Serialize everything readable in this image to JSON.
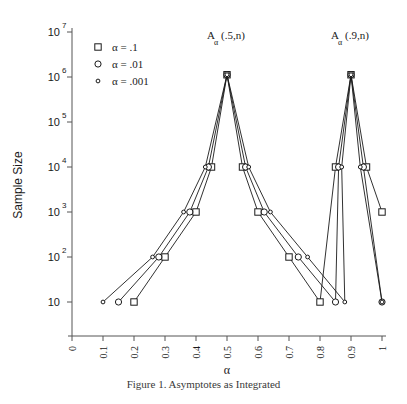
{
  "figure": {
    "caption": "Figure 1.  Asymptotes as Integrated"
  },
  "chart_data": {
    "type": "line",
    "title": "",
    "xlabel": "α",
    "ylabel": "Sample Size",
    "xlim": [
      0,
      1
    ],
    "ylim_log10": [
      1,
      7
    ],
    "yscale": "log",
    "xticks": [
      "0",
      "0.1",
      "0.2",
      "0.3",
      "0.4",
      "0.5",
      "0.6",
      "0.7",
      "0.8",
      "0.9",
      "1"
    ],
    "xtick_values": [
      0,
      0.1,
      0.2,
      0.3,
      0.4,
      0.5,
      0.6,
      0.7,
      0.8,
      0.9,
      1
    ],
    "ytick_labels": [
      "10",
      "10",
      "10",
      "10",
      "10",
      "10",
      "10"
    ],
    "ytick_exponents": [
      "",
      "2",
      "3",
      "4",
      "5",
      "6",
      "7"
    ],
    "ytick_values": [
      10,
      100,
      1000,
      10000,
      100000,
      1000000,
      10000000
    ],
    "grid": false,
    "legend_position": "top-left",
    "annotations": [
      {
        "id": "left-peak-label",
        "base": "A",
        "sub": "α",
        "arg": "(.5,n)",
        "x": 0.5,
        "y_log10": 6.85
      },
      {
        "id": "right-peak-label",
        "base": "A",
        "sub": "α",
        "arg": "(.9,n)",
        "x": 0.9,
        "y_log10": 6.85
      }
    ],
    "series": [
      {
        "name": "α = .1",
        "marker": "square",
        "x": [
          0.2,
          0.3,
          0.4,
          0.45,
          0.5,
          0.55,
          0.6,
          0.7,
          0.8,
          0.85,
          0.9,
          0.95,
          1.0
        ],
        "y_log10": [
          1.0,
          2.0,
          3.0,
          4.0,
          6.05,
          4.0,
          3.0,
          2.0,
          1.0,
          4.0,
          6.05,
          4.0,
          3.0
        ],
        "y": [
          10,
          100,
          1000,
          10000,
          1122018,
          10000,
          1000,
          100,
          10,
          10000,
          1122018,
          10000,
          1000
        ]
      },
      {
        "name": "α = .01",
        "marker": "circle",
        "x": [
          0.15,
          0.28,
          0.38,
          0.44,
          0.5,
          0.56,
          0.62,
          0.73,
          0.85,
          0.86,
          0.9,
          0.94,
          1.0
        ],
        "y_log10": [
          1.0,
          2.0,
          3.0,
          4.0,
          6.05,
          4.0,
          3.0,
          2.0,
          1.0,
          4.0,
          6.05,
          4.0,
          1.0
        ],
        "y": [
          10,
          100,
          1000,
          10000,
          1122018,
          10000,
          1000,
          100,
          10,
          10000,
          1122018,
          10000,
          10
        ]
      },
      {
        "name": "α = .001",
        "marker": "small-circle",
        "x": [
          0.1,
          0.26,
          0.36,
          0.43,
          0.5,
          0.57,
          0.64,
          0.76,
          0.88,
          0.87,
          0.9,
          0.93,
          1.0
        ],
        "y_log10": [
          1.0,
          2.0,
          3.0,
          4.0,
          6.05,
          4.0,
          3.0,
          2.0,
          1.0,
          4.0,
          6.05,
          4.0,
          1.0
        ],
        "y": [
          10,
          100,
          1000,
          10000,
          1122018,
          10000,
          1000,
          100,
          10,
          10000,
          1122018,
          10000,
          10
        ]
      }
    ],
    "legend": [
      {
        "label": "α = .1",
        "marker": "square"
      },
      {
        "label": "α = .01",
        "marker": "circle"
      },
      {
        "label": "α = .001",
        "marker": "small-circle"
      }
    ]
  }
}
